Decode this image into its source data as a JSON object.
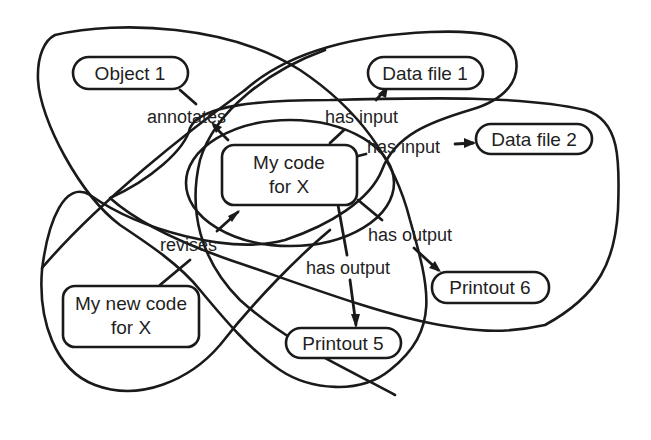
{
  "diagram": {
    "type": "concept-graph-with-overlapping-sets",
    "nodes": [
      {
        "id": "object1",
        "lines": [
          "Object 1"
        ]
      },
      {
        "id": "datafile1",
        "lines": [
          "Data file 1"
        ]
      },
      {
        "id": "datafile2",
        "lines": [
          "Data file 2"
        ]
      },
      {
        "id": "mycode",
        "lines": [
          "My code",
          "for X"
        ]
      },
      {
        "id": "mynewcode",
        "lines": [
          "My new code",
          "for X"
        ]
      },
      {
        "id": "printout5",
        "lines": [
          "Printout 5"
        ]
      },
      {
        "id": "printout6",
        "lines": [
          "Printout 6"
        ]
      }
    ],
    "edges": [
      {
        "from": "object1",
        "to": "mycode",
        "label": "annotates"
      },
      {
        "from": "mycode",
        "to": "datafile1",
        "label": "has input"
      },
      {
        "from": "mycode",
        "to": "datafile2",
        "label": "has input"
      },
      {
        "from": "mynewcode",
        "to": "mycode",
        "label": "revises"
      },
      {
        "from": "mycode",
        "to": "printout6",
        "label": "has output"
      },
      {
        "from": "mycode",
        "to": "printout5",
        "label": "has output"
      }
    ],
    "colors": {
      "stroke": "#1a1a1a",
      "background": "#ffffff",
      "text": "#1f1f1f"
    }
  },
  "labels": {
    "object1": "Object 1",
    "datafile1": "Data file 1",
    "datafile2": "Data file 2",
    "mycode_l1": "My code",
    "mycode_l2": "for X",
    "mynewcode_l1": "My new code",
    "mynewcode_l2": "for X",
    "printout5": "Printout 5",
    "printout6": "Printout 6",
    "annotates": "annotates",
    "has_input_1": "has input",
    "has_input_2": "has input",
    "revises": "revises",
    "has_output_6": "has output",
    "has_output_5": "has output"
  }
}
